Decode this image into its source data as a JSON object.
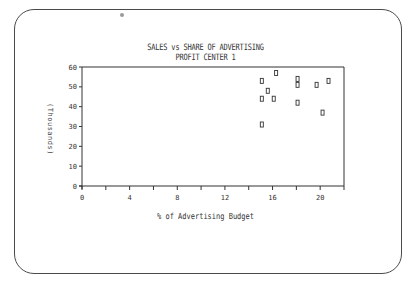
{
  "chart_data": {
    "type": "scatter",
    "title": "SALES vs SHARE OF ADVERTISING",
    "subtitle": "PROFIT CENTER 1",
    "xlabel": "% of Advertising Budget",
    "ylabel": "(Thousands)",
    "xlim": [
      0,
      22
    ],
    "ylim": [
      0,
      60
    ],
    "x_ticks": [
      0,
      4,
      8,
      12,
      16,
      20
    ],
    "x_minor_ticks": [
      2,
      6,
      10,
      14,
      18,
      22
    ],
    "y_ticks": [
      0,
      10,
      20,
      30,
      40,
      50,
      60
    ],
    "grid": false,
    "legend": null,
    "marker": "square",
    "series": [
      {
        "name": "Profit Center 1",
        "points": [
          {
            "x": 15.1,
            "y": 53
          },
          {
            "x": 16.3,
            "y": 57
          },
          {
            "x": 15.6,
            "y": 48
          },
          {
            "x": 15.1,
            "y": 44
          },
          {
            "x": 16.1,
            "y": 44
          },
          {
            "x": 15.1,
            "y": 31
          },
          {
            "x": 18.1,
            "y": 54
          },
          {
            "x": 18.1,
            "y": 51
          },
          {
            "x": 18.1,
            "y": 42
          },
          {
            "x": 19.7,
            "y": 51
          },
          {
            "x": 20.7,
            "y": 53
          },
          {
            "x": 20.2,
            "y": 37
          }
        ]
      }
    ]
  },
  "colors": {
    "ink": "#333333",
    "frame": "#4a4a4a",
    "background": "#ffffff"
  }
}
